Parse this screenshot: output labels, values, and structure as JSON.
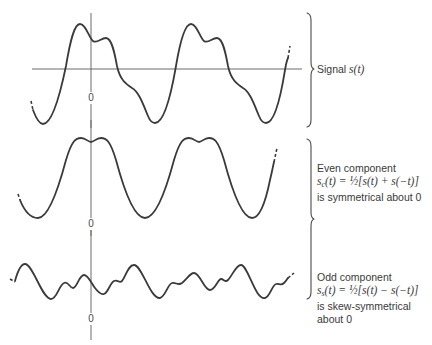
{
  "figure": {
    "type": "signal-decomposition-diagram",
    "colors": {
      "curve": "#3a3a3a",
      "axis": "#6a6a6a",
      "text": "#3a3a3a",
      "background": "#ffffff"
    },
    "panels": [
      {
        "id": "signal",
        "zero_label": "0",
        "label_lines": [
          {
            "text": "Signal ",
            "math": "s(t)"
          }
        ],
        "has_horizontal_axis": true
      },
      {
        "id": "even",
        "zero_label": "0",
        "title": "Even component",
        "formula": {
          "lhs": "s",
          "lhs_sub": "c",
          "lhs_arg": "(t)",
          "eq": " = ½[s(t) + s(−t)]"
        },
        "note": "is symmetrical about 0"
      },
      {
        "id": "odd",
        "zero_label": "0",
        "title": "Odd component",
        "formula": {
          "lhs": "s",
          "lhs_sub": "s",
          "lhs_arg": "(t)",
          "eq": " = ½[s(t) − s(−t)]"
        },
        "note_lines": [
          "is skew-symmetrical",
          "about 0"
        ]
      }
    ]
  }
}
